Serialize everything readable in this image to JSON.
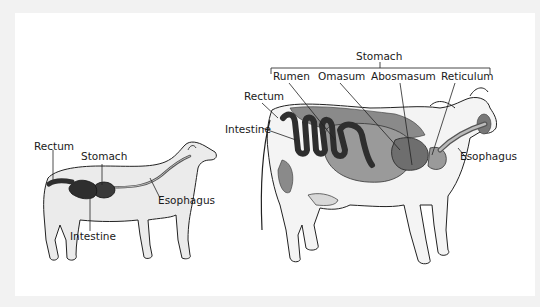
{
  "dog": {
    "labels": {
      "rectum": "Rectum",
      "stomach": "Stomach",
      "esophagus": "Esophagus",
      "intestine": "Intestine"
    }
  },
  "cow": {
    "labels": {
      "stomach": "Stomach",
      "rumen": "Rumen",
      "omasum": "Omasum",
      "abosmasum": "Abosmasum",
      "reticulum": "Reticulum",
      "rectum": "Rectum",
      "intestine": "Intestine",
      "esophagus": "Esophagus"
    }
  },
  "colors": {
    "background": "#f2f2f2",
    "panel": "#ffffff",
    "body_fill": "#ebebeb",
    "outline": "#222222",
    "organ_dark": "#3a3a3a",
    "organ_mid": "#6e6e6e",
    "organ_light": "#9a9a9a"
  }
}
